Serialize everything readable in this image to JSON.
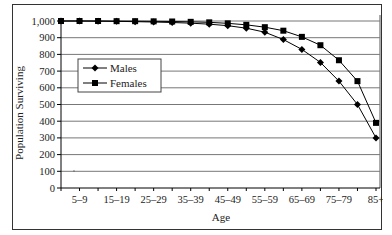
{
  "chart_data": {
    "type": "line",
    "title": "",
    "xlabel": "Age",
    "ylabel": "Population Surviving",
    "ylim": [
      0,
      1000
    ],
    "yticks": [
      0,
      100,
      200,
      300,
      400,
      500,
      600,
      700,
      800,
      900,
      1000
    ],
    "ytick_labels": [
      "0",
      "100",
      "200",
      "300",
      "400",
      "500",
      "600",
      "700",
      "800",
      "900",
      "1,000"
    ],
    "categories": [
      "0–4",
      "5–9",
      "10–14",
      "15–19",
      "20–24",
      "25–29",
      "30–34",
      "35–39",
      "40–44",
      "45–49",
      "50–54",
      "55–59",
      "60–64",
      "65–69",
      "70–74",
      "75–79",
      "80–84",
      "85+"
    ],
    "xtick_labels_shown": [
      "5–9",
      "15–19",
      "25–29",
      "35–39",
      "45–49",
      "55–59",
      "65–69",
      "75–79",
      "85+"
    ],
    "series": [
      {
        "name": "Males",
        "marker": "diamond",
        "values": [
          1000,
          1000,
          999,
          998,
          996,
          994,
          991,
          987,
          981,
          972,
          957,
          933,
          889,
          830,
          752,
          640,
          500,
          300
        ]
      },
      {
        "name": "Females",
        "marker": "square",
        "values": [
          1000,
          1000,
          1000,
          999,
          999,
          998,
          997,
          995,
          992,
          986,
          977,
          963,
          942,
          905,
          855,
          765,
          640,
          390
        ]
      }
    ],
    "grid": {
      "horizontal": true,
      "vertical": false
    },
    "legend": {
      "position": "inside-upper-left",
      "entries": [
        "Males",
        "Females"
      ]
    }
  }
}
